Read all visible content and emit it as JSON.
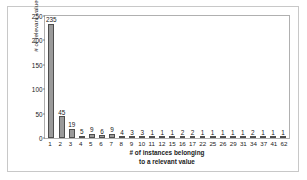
{
  "chart_data": {
    "type": "bar",
    "title": "",
    "xlabel": "# of instances belonging to a relevant value",
    "xlabel_line1": "# of instances belonging",
    "xlabel_line2": "to a relevant value",
    "ylabel": "# of relevant values",
    "ylim": [
      0,
      250
    ],
    "ytick_labels": [
      "250",
      "200",
      "150",
      "100",
      "50",
      "0"
    ],
    "ytick_values": [
      250,
      200,
      150,
      100,
      50,
      0
    ],
    "grid": false,
    "legend": false,
    "bar_color": "#9a9a9a",
    "bar_edge_color": "#4d4d4d",
    "categories": [
      "1",
      "2",
      "3",
      "4",
      "5",
      "6",
      "7",
      "8",
      "9",
      "10",
      "11",
      "12",
      "15",
      "16",
      "17",
      "22",
      "25",
      "26",
      "29",
      "31",
      "34",
      "37",
      "41",
      "62"
    ],
    "values": [
      235,
      45,
      19,
      5,
      9,
      6,
      9,
      4,
      3,
      3,
      1,
      1,
      1,
      2,
      2,
      1,
      1,
      1,
      1,
      1,
      2,
      1,
      1,
      1
    ],
    "data_labels": [
      "235",
      "45",
      "19",
      "5",
      "9",
      "6",
      "9",
      "4",
      "3",
      "3",
      "1",
      "1",
      "1",
      "2",
      "2",
      "1",
      "1",
      "1",
      "1",
      "1",
      "2",
      "1",
      "1",
      "1"
    ]
  }
}
